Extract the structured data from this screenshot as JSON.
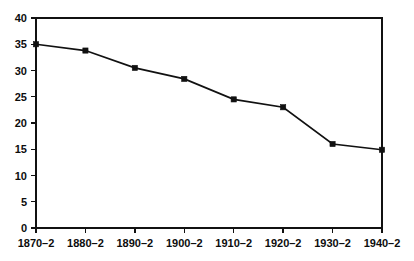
{
  "chart_data": {
    "type": "line",
    "title": "",
    "subtitle": "",
    "xlabel": "",
    "ylabel": "",
    "categories": [
      "1870–2",
      "1880–2",
      "1890–2",
      "1900–2",
      "1910–2",
      "1920–2",
      "1930–2",
      "1940–2"
    ],
    "values": [
      35.0,
      33.8,
      30.5,
      28.4,
      24.5,
      23.0,
      16.0,
      14.9
    ],
    "series": [
      {
        "name": "",
        "values": [
          35.0,
          33.8,
          30.5,
          28.4,
          24.5,
          23.0,
          16.0,
          14.9
        ]
      }
    ],
    "ylim": [
      0,
      40
    ],
    "ytick_values": [
      0,
      5,
      10,
      15,
      20,
      25,
      30,
      35,
      40
    ],
    "ytick_labels": [
      "0",
      "5",
      "10",
      "15",
      "20",
      "25",
      "30",
      "35",
      "40"
    ],
    "xtick_labels": [
      "1870–2",
      "1880–2",
      "1890–2",
      "1900–2",
      "1910–2",
      "1920–2",
      "1930–2",
      "1940–2"
    ],
    "grid": false,
    "legend": false,
    "legend_position": "none",
    "marker": "filled-square",
    "line_color": "#111111",
    "marker_color": "#111111",
    "background_color": "#ffffff",
    "axis_color": "#111111",
    "annotations": []
  }
}
